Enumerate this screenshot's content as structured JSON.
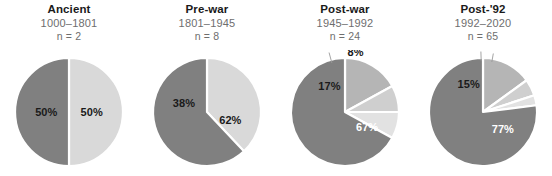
{
  "figure": {
    "background": "#ffffff",
    "panel_count": 4
  },
  "chart_data": {
    "type": "pie",
    "title": "",
    "subtitle": "",
    "legend": "none",
    "colors": {
      "dark": "#808080",
      "medium": "#b5b5b5",
      "light": "#d0d0d0",
      "lightest": "#e2e2e2",
      "separator": "#ffffff",
      "title_color": "#1a1a1a",
      "subtitle_color": "#6e6e6e"
    },
    "panels": [
      {
        "title": "Ancient",
        "range": "1000–1801",
        "n_label": "n = 2",
        "n": 2,
        "start_angle": 0,
        "slices": [
          {
            "label": "50%",
            "value": 50,
            "color": "#d9d9d9",
            "label_color": "dark-text",
            "label_inside": true,
            "label_r": 0.42,
            "label_angle": 270
          },
          {
            "label": "50%",
            "value": 50,
            "color": "#808080",
            "label_color": "dark-text",
            "label_inside": true,
            "label_r": 0.42,
            "label_angle": 90
          }
        ]
      },
      {
        "title": "Pre-war",
        "range": "1801–1945",
        "n_label": "n = 8",
        "n": 8,
        "start_angle": 0,
        "slices": [
          {
            "label": "38%",
            "value": 38,
            "color": "#d9d9d9",
            "label_color": "dark-text",
            "label_inside": true,
            "label_r": 0.46,
            "label_angle": 292
          },
          {
            "label": "62%",
            "value": 62,
            "color": "#808080",
            "label_color": "dark-text",
            "label_inside": true,
            "label_r": 0.46,
            "label_angle": 110
          }
        ]
      },
      {
        "title": "Post-war",
        "range": "1945–1992",
        "n_label": "n = 24",
        "n": 24,
        "start_angle": 0,
        "slices": [
          {
            "label": "17%",
            "value": 17,
            "color": "#b5b5b5",
            "label_color": "dark-text",
            "label_inside": true,
            "label_r": 0.56,
            "label_angle": 329
          },
          {
            "label": "8%",
            "value": 8,
            "color": "#cfcfcf",
            "label_color": "dark-text",
            "label_inside": false,
            "label_r": 1.32,
            "label_angle": 345
          },
          {
            "label": "8%",
            "value": 8,
            "color": "#e2e2e2",
            "label_color": "dark-text",
            "label_inside": false,
            "label_r": 1.12,
            "label_angle": 10
          },
          {
            "label": "67%",
            "value": 67,
            "color": "#808080",
            "label_color": "white-text",
            "label_inside": true,
            "label_r": 0.5,
            "label_angle": 125
          }
        ]
      },
      {
        "title": "Post-'92",
        "range": "1992–2020",
        "n_label": "n = 65",
        "n": 65,
        "start_angle": 0,
        "slices": [
          {
            "label": "15%",
            "value": 15,
            "color": "#b5b5b5",
            "label_color": "dark-text",
            "label_inside": true,
            "label_r": 0.58,
            "label_angle": 333
          },
          {
            "label": "5%",
            "value": 5,
            "color": "#cfcfcf",
            "label_color": "dark-text",
            "label_inside": false,
            "label_r": 1.3,
            "label_angle": 358
          },
          {
            "label": "3%",
            "value": 3,
            "color": "#e2e2e2",
            "label_color": "dark-text",
            "label_inside": false,
            "label_r": 1.28,
            "label_angle": 10
          },
          {
            "label": "77%",
            "value": 77,
            "color": "#808080",
            "label_color": "white-text",
            "label_inside": true,
            "label_r": 0.48,
            "label_angle": 130
          }
        ]
      }
    ]
  }
}
